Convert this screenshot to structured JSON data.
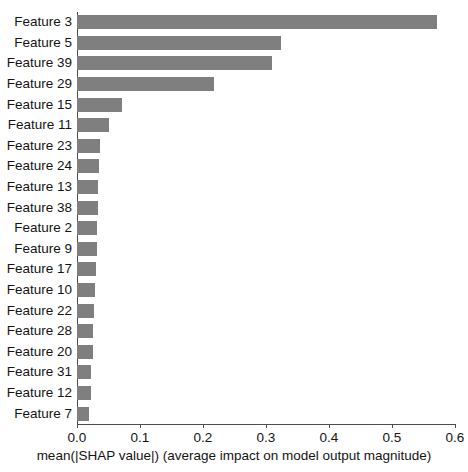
{
  "chart_data": {
    "type": "bar",
    "orientation": "horizontal",
    "title": "",
    "xlabel": "mean(|SHAP value|) (average impact on model output magnitude)",
    "ylabel": "",
    "xlim": [
      0.0,
      0.6
    ],
    "ylim": null,
    "grid": false,
    "legend": null,
    "bar_color": "#7f7f7f",
    "xticks": [
      0.0,
      0.1,
      0.2,
      0.3,
      0.4,
      0.5,
      0.6
    ],
    "xtick_labels": [
      "0.0",
      "0.1",
      "0.2",
      "0.3",
      "0.4",
      "0.5",
      "0.6"
    ],
    "categories": [
      "Feature 3",
      "Feature 5",
      "Feature 39",
      "Feature 29",
      "Feature 15",
      "Feature 11",
      "Feature 23",
      "Feature 24",
      "Feature 13",
      "Feature 38",
      "Feature 2",
      "Feature 9",
      "Feature 17",
      "Feature 10",
      "Feature 22",
      "Feature 28",
      "Feature 20",
      "Feature 31",
      "Feature 12",
      "Feature 7"
    ],
    "values": [
      0.571,
      0.324,
      0.31,
      0.218,
      0.071,
      0.051,
      0.036,
      0.035,
      0.034,
      0.033,
      0.032,
      0.031,
      0.03,
      0.029,
      0.027,
      0.026,
      0.025,
      0.023,
      0.022,
      0.019
    ]
  }
}
